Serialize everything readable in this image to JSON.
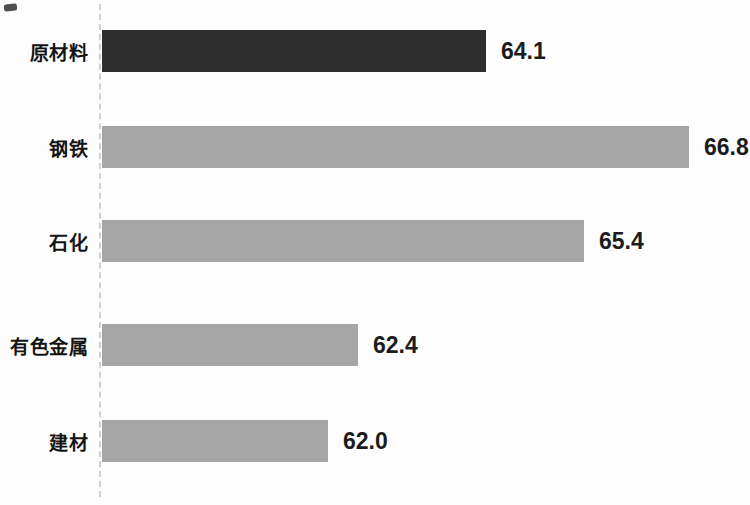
{
  "chart_data": {
    "type": "bar",
    "orientation": "horizontal",
    "title": "",
    "xlabel": "",
    "ylabel": "",
    "categories": [
      "原材料",
      "钢铁",
      "石化",
      "有色金属",
      "建材"
    ],
    "values": [
      64.1,
      66.8,
      65.4,
      62.4,
      62.0
    ],
    "value_labels": [
      "64.1",
      "66.8",
      "65.4",
      "62.4",
      "62.0"
    ],
    "xlim": [
      59.0,
      67.5
    ],
    "grid": false,
    "legend": false,
    "bar_colors": [
      "#2e2e2e",
      "#a6a6a6",
      "#a6a6a6",
      "#a6a6a6",
      "#a6a6a6"
    ],
    "colors": {
      "highlight_bar": "#2e2e2e",
      "default_bar": "#a6a6a6",
      "axis_line": "#c9c9c9",
      "label_text": "#141414",
      "value_text": "#1c1c1c",
      "background": "#fdfdfd"
    }
  }
}
